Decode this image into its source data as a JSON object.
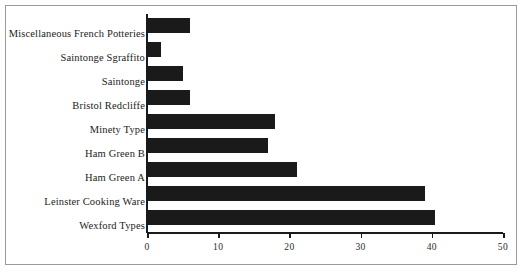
{
  "chart_data": {
    "type": "bar",
    "orientation": "horizontal",
    "title": "",
    "subtitle": "",
    "xlabel": "",
    "ylabel": "",
    "xlim": [
      0,
      50
    ],
    "ylim": null,
    "grid": false,
    "legend": null,
    "legend_position": "none",
    "xticks": [
      0,
      10,
      20,
      30,
      40,
      50
    ],
    "xtick_labels": [
      "0",
      "10",
      "20",
      "30",
      "40",
      "50"
    ],
    "categories": [
      "Miscellaneous French Potteries",
      "Saintonge Sgraffito",
      "Saintonge",
      "Bristol Redcliffe",
      "Minety Type",
      "Ham Green B",
      "Ham Green A",
      "Leinster Cooking Ware",
      "Wexford Types"
    ],
    "values": [
      6,
      2,
      5,
      6,
      18,
      17,
      21,
      39,
      40.5
    ],
    "bar_color": "#1a1a1a",
    "axis_color": "#1a1a1a",
    "frame_color": "#9a9a9a",
    "background_color": "#ffffff"
  }
}
